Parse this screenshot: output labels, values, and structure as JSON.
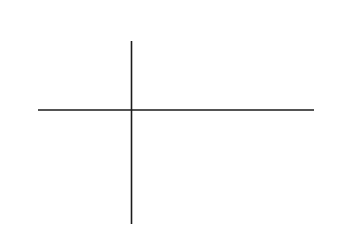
{
  "chart_data": {
    "type": "line",
    "title": "",
    "xlabel": "x",
    "ylabel": "y",
    "xlim": [
      -2,
      4
    ],
    "ylim": [
      -8,
      4
    ],
    "grid": false,
    "legend": null,
    "xticks": [
      -2,
      -1,
      1,
      2,
      3,
      4
    ],
    "xtick_labels": [
      "-2",
      "-1",
      "1",
      "2",
      "3",
      "4"
    ],
    "yticks": [
      4,
      2,
      -2,
      -4,
      -6,
      -8
    ],
    "ytick_labels": [
      "4",
      "2",
      "-2",
      "-4",
      "-6",
      "-8"
    ],
    "minor_tick_step": 0.2,
    "series": [
      {
        "name": "parabola",
        "equation": "y = 3 - x^2",
        "x": [
          -1.85,
          -1.6,
          -1.4,
          -1.2,
          -1.0,
          -0.8,
          -0.6,
          -0.4,
          -0.2,
          0.0,
          0.2,
          0.4,
          0.6,
          0.8,
          1.0,
          1.2,
          1.4,
          1.6,
          1.8,
          2.0,
          2.2,
          2.4,
          2.6,
          2.8,
          3.0,
          3.2,
          3.35
        ],
        "values": [
          -0.42,
          0.44,
          1.04,
          1.56,
          2.0,
          2.36,
          2.64,
          2.84,
          2.96,
          3.0,
          2.96,
          2.84,
          2.64,
          2.36,
          2.0,
          1.56,
          1.04,
          0.44,
          -0.24,
          -1.0,
          -1.84,
          -2.76,
          -3.76,
          -4.84,
          -6.0,
          -7.24,
          -8.22
        ]
      },
      {
        "name": "line",
        "equation": "y = -2x",
        "x": [
          -2.05,
          4.0
        ],
        "values": [
          4.1,
          -8.0
        ]
      }
    ],
    "shaded_region": {
      "name": "area-between-curves",
      "between": [
        "parabola",
        "line"
      ],
      "x_range": [
        -1,
        3
      ],
      "fill_color": "#e6e6e6"
    },
    "intersections": [
      {
        "x": -1,
        "y": 2
      },
      {
        "x": 3,
        "y": -6
      }
    ],
    "curve_color": "#1b1b1b",
    "axis_color": "#1b1b1b"
  }
}
